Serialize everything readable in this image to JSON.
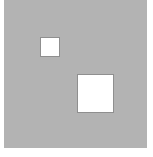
{
  "image": {
    "background_color": "#ffffff",
    "field_color": "#b3b3b3",
    "square_color": "#ffffff",
    "shapes": [
      {
        "name": "small-white-square",
        "x": 40,
        "y": 37,
        "width": 20,
        "height": 20
      },
      {
        "name": "large-white-square",
        "x": 77,
        "y": 74,
        "width": 37,
        "height": 39
      }
    ]
  }
}
